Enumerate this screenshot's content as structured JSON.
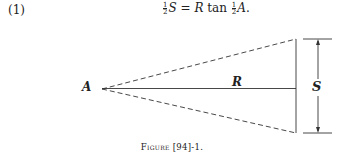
{
  "equation": {
    "number": "(1)",
    "lhs_frac_num": "1",
    "lhs_frac_den": "2",
    "lhs_var": "S",
    "equals": "=",
    "rhs_var": "R",
    "func": "tan",
    "rhs_frac_num": "1",
    "rhs_frac_den": "2",
    "rhs_angle": "A",
    "end": "."
  },
  "diagram": {
    "apex_label": "A",
    "radius_label": "R",
    "span_label": "S"
  },
  "caption": {
    "prefix": "Figure",
    "ref": " [94]-1."
  }
}
